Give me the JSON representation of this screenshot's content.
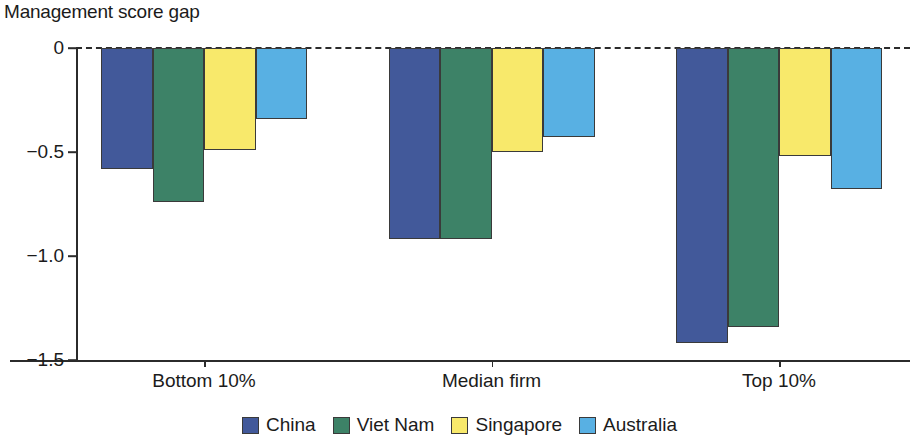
{
  "chart_data": {
    "type": "bar",
    "title": "Management score gap",
    "xlabel": "",
    "ylabel": "",
    "categories": [
      "Bottom 10%",
      "Median firm",
      "Top 10%"
    ],
    "series": [
      {
        "name": "China",
        "color": "#42599a",
        "values": [
          -0.58,
          -0.92,
          -1.42
        ]
      },
      {
        "name": "Viet Nam",
        "color": "#3d8267",
        "values": [
          -0.74,
          -0.92,
          -1.34
        ]
      },
      {
        "name": "Singapore",
        "color": "#f8e96b",
        "values": [
          -0.49,
          -0.5,
          -0.52
        ]
      },
      {
        "name": "Australia",
        "color": "#58b0e3",
        "values": [
          -0.34,
          -0.43,
          -0.68
        ]
      }
    ],
    "ylim": [
      -1.5,
      0
    ],
    "yticks": [
      0,
      -0.5,
      -1.0,
      -1.5
    ],
    "ytick_labels": [
      "0",
      "−0.5",
      "−1.0",
      "−1.5"
    ],
    "grid": false,
    "zero_line": "dashed",
    "legend_position": "bottom",
    "legend_entries": [
      "China",
      "Viet Nam",
      "Singapore",
      "Australia"
    ]
  }
}
